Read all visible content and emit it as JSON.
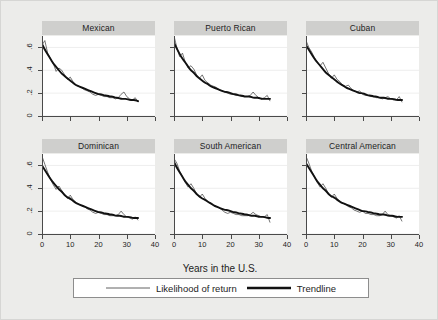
{
  "chart_data": {
    "type": "line",
    "title": "",
    "subtitle": "",
    "xlabel": "Years in the U.S.",
    "ylabel": "",
    "xlim": [
      0,
      40
    ],
    "ylim": [
      0,
      0.7
    ],
    "xticks": [
      0,
      10,
      20,
      30,
      40
    ],
    "xticklabels": [
      "0",
      "10",
      "20",
      "30",
      "40"
    ],
    "yticks": [
      0,
      0.2,
      0.4,
      0.6
    ],
    "yticklabels": [
      "0",
      ".2",
      ".4",
      ".6"
    ],
    "grid": "horizontal",
    "legend_position": "bottom",
    "legend": [
      "Likelihood of return",
      "Trendline"
    ],
    "layout": "2 rows x 3 columns small multiples",
    "panels": [
      {
        "title": "Mexican",
        "x": [
          0,
          1,
          2,
          3,
          4,
          5,
          6,
          7,
          8,
          9,
          10,
          11,
          12,
          13,
          14,
          15,
          16,
          17,
          18,
          19,
          20,
          21,
          22,
          23,
          24,
          25,
          26,
          27,
          28,
          29,
          30,
          31,
          32,
          33,
          34
        ],
        "series": [
          {
            "name": "Likelihood of return",
            "values": [
              0.62,
              0.66,
              0.55,
              0.5,
              0.46,
              0.39,
              0.42,
              0.4,
              0.36,
              0.32,
              0.34,
              0.3,
              0.27,
              0.26,
              0.25,
              0.23,
              0.22,
              0.21,
              0.19,
              0.18,
              0.19,
              0.18,
              0.17,
              0.17,
              0.16,
              0.16,
              0.15,
              0.16,
              0.19,
              0.21,
              0.17,
              0.15,
              0.14,
              0.16,
              0.12
            ]
          },
          {
            "name": "Trendline",
            "values": [
              0.63,
              0.58,
              0.54,
              0.5,
              0.46,
              0.43,
              0.4,
              0.37,
              0.35,
              0.33,
              0.31,
              0.29,
              0.27,
              0.26,
              0.25,
              0.24,
              0.23,
              0.22,
              0.21,
              0.2,
              0.19,
              0.19,
              0.18,
              0.18,
              0.17,
              0.17,
              0.16,
              0.16,
              0.15,
              0.15,
              0.15,
              0.14,
              0.14,
              0.14,
              0.13
            ]
          }
        ]
      },
      {
        "title": "Puerto Rican",
        "x": [
          0,
          1,
          2,
          3,
          4,
          5,
          6,
          7,
          8,
          9,
          10,
          11,
          12,
          13,
          14,
          15,
          16,
          17,
          18,
          19,
          20,
          21,
          22,
          23,
          24,
          25,
          26,
          27,
          28,
          29,
          30,
          31,
          32,
          33,
          34
        ],
        "series": [
          {
            "name": "Likelihood of return",
            "values": [
              0.7,
              0.6,
              0.52,
              0.55,
              0.47,
              0.42,
              0.44,
              0.41,
              0.36,
              0.33,
              0.36,
              0.31,
              0.29,
              0.27,
              0.26,
              0.25,
              0.23,
              0.22,
              0.21,
              0.2,
              0.19,
              0.19,
              0.18,
              0.18,
              0.17,
              0.17,
              0.17,
              0.18,
              0.21,
              0.18,
              0.16,
              0.15,
              0.16,
              0.18,
              0.13
            ]
          },
          {
            "name": "Trendline",
            "values": [
              0.64,
              0.59,
              0.54,
              0.5,
              0.47,
              0.43,
              0.4,
              0.38,
              0.35,
              0.33,
              0.31,
              0.29,
              0.28,
              0.26,
              0.25,
              0.24,
              0.23,
              0.22,
              0.21,
              0.21,
              0.2,
              0.19,
              0.19,
              0.18,
              0.18,
              0.17,
              0.17,
              0.17,
              0.16,
              0.16,
              0.16,
              0.15,
              0.15,
              0.15,
              0.15
            ]
          }
        ]
      },
      {
        "title": "Cuban",
        "x": [
          0,
          1,
          2,
          3,
          4,
          5,
          6,
          7,
          8,
          9,
          10,
          11,
          12,
          13,
          14,
          15,
          16,
          17,
          18,
          19,
          20,
          21,
          22,
          23,
          24,
          25,
          26,
          27,
          28,
          29,
          30,
          31,
          32,
          33,
          34
        ],
        "series": [
          {
            "name": "Likelihood of return",
            "values": [
              0.66,
              0.6,
              0.56,
              0.51,
              0.47,
              0.44,
              0.47,
              0.42,
              0.37,
              0.33,
              0.36,
              0.32,
              0.3,
              0.27,
              0.26,
              0.27,
              0.24,
              0.22,
              0.21,
              0.22,
              0.19,
              0.18,
              0.18,
              0.17,
              0.17,
              0.16,
              0.16,
              0.15,
              0.16,
              0.17,
              0.15,
              0.14,
              0.14,
              0.17,
              0.12
            ]
          },
          {
            "name": "Trendline",
            "values": [
              0.62,
              0.58,
              0.54,
              0.5,
              0.47,
              0.44,
              0.41,
              0.38,
              0.36,
              0.34,
              0.32,
              0.3,
              0.28,
              0.27,
              0.25,
              0.24,
              0.23,
              0.22,
              0.21,
              0.2,
              0.2,
              0.19,
              0.18,
              0.18,
              0.17,
              0.17,
              0.16,
              0.16,
              0.16,
              0.15,
              0.15,
              0.15,
              0.14,
              0.14,
              0.14
            ]
          }
        ]
      },
      {
        "title": "Dominican",
        "x": [
          0,
          1,
          2,
          3,
          4,
          5,
          6,
          7,
          8,
          9,
          10,
          11,
          12,
          13,
          14,
          15,
          16,
          17,
          18,
          19,
          20,
          21,
          22,
          23,
          24,
          25,
          26,
          27,
          28,
          29,
          30,
          31,
          32,
          33,
          34
        ],
        "series": [
          {
            "name": "Likelihood of return",
            "values": [
              0.68,
              0.61,
              0.54,
              0.48,
              0.43,
              0.39,
              0.42,
              0.38,
              0.34,
              0.31,
              0.34,
              0.3,
              0.28,
              0.26,
              0.25,
              0.24,
              0.22,
              0.21,
              0.19,
              0.18,
              0.19,
              0.18,
              0.17,
              0.17,
              0.16,
              0.16,
              0.16,
              0.17,
              0.2,
              0.17,
              0.15,
              0.14,
              0.13,
              0.15,
              0.12
            ]
          },
          {
            "name": "Trendline",
            "values": [
              0.6,
              0.56,
              0.52,
              0.48,
              0.45,
              0.42,
              0.39,
              0.37,
              0.34,
              0.32,
              0.31,
              0.29,
              0.27,
              0.26,
              0.25,
              0.24,
              0.23,
              0.22,
              0.21,
              0.2,
              0.19,
              0.19,
              0.18,
              0.18,
              0.17,
              0.17,
              0.16,
              0.16,
              0.16,
              0.15,
              0.15,
              0.15,
              0.14,
              0.14,
              0.14
            ]
          }
        ]
      },
      {
        "title": "South American",
        "x": [
          0,
          1,
          2,
          3,
          4,
          5,
          6,
          7,
          8,
          9,
          10,
          11,
          12,
          13,
          14,
          15,
          16,
          17,
          18,
          19,
          20,
          21,
          22,
          23,
          24,
          25,
          26,
          27,
          28,
          29,
          30,
          31,
          32,
          33,
          34
        ],
        "series": [
          {
            "name": "Likelihood of return",
            "values": [
              0.66,
              0.62,
              0.55,
              0.5,
              0.45,
              0.41,
              0.44,
              0.4,
              0.35,
              0.32,
              0.35,
              0.31,
              0.28,
              0.27,
              0.25,
              0.24,
              0.23,
              0.21,
              0.19,
              0.18,
              0.19,
              0.18,
              0.17,
              0.17,
              0.16,
              0.16,
              0.16,
              0.17,
              0.19,
              0.17,
              0.16,
              0.15,
              0.15,
              0.17,
              0.1
            ]
          },
          {
            "name": "Trendline",
            "values": [
              0.63,
              0.58,
              0.54,
              0.5,
              0.46,
              0.43,
              0.4,
              0.38,
              0.35,
              0.33,
              0.31,
              0.3,
              0.28,
              0.27,
              0.25,
              0.24,
              0.23,
              0.22,
              0.21,
              0.21,
              0.2,
              0.19,
              0.19,
              0.18,
              0.18,
              0.17,
              0.17,
              0.16,
              0.16,
              0.16,
              0.15,
              0.15,
              0.15,
              0.14,
              0.14
            ]
          }
        ]
      },
      {
        "title": "Central American",
        "x": [
          0,
          1,
          2,
          3,
          4,
          5,
          6,
          7,
          8,
          9,
          10,
          11,
          12,
          13,
          14,
          15,
          16,
          17,
          18,
          19,
          20,
          21,
          22,
          23,
          24,
          25,
          26,
          27,
          28,
          29,
          30,
          31,
          32,
          33,
          34
        ],
        "series": [
          {
            "name": "Likelihood of return",
            "values": [
              0.68,
              0.62,
              0.55,
              0.5,
              0.45,
              0.41,
              0.44,
              0.4,
              0.35,
              0.32,
              0.35,
              0.31,
              0.29,
              0.27,
              0.26,
              0.24,
              0.23,
              0.21,
              0.2,
              0.19,
              0.2,
              0.18,
              0.18,
              0.17,
              0.17,
              0.16,
              0.16,
              0.17,
              0.2,
              0.17,
              0.16,
              0.15,
              0.14,
              0.16,
              0.11
            ]
          },
          {
            "name": "Trendline",
            "values": [
              0.62,
              0.58,
              0.54,
              0.5,
              0.46,
              0.43,
              0.4,
              0.38,
              0.35,
              0.33,
              0.32,
              0.3,
              0.28,
              0.27,
              0.26,
              0.25,
              0.24,
              0.23,
              0.22,
              0.21,
              0.2,
              0.2,
              0.19,
              0.19,
              0.18,
              0.18,
              0.17,
              0.17,
              0.17,
              0.16,
              0.16,
              0.16,
              0.15,
              0.15,
              0.15
            ]
          }
        ]
      }
    ]
  },
  "style": {
    "figure_background": "#ececea",
    "panel_background": "#ffffff",
    "title_band": "#cfcfcd",
    "axis_color": "#4a4a4a",
    "grid_color": "#e2e2e0",
    "data_line_color": "#3a3a3a",
    "trend_line_color": "#111111"
  }
}
